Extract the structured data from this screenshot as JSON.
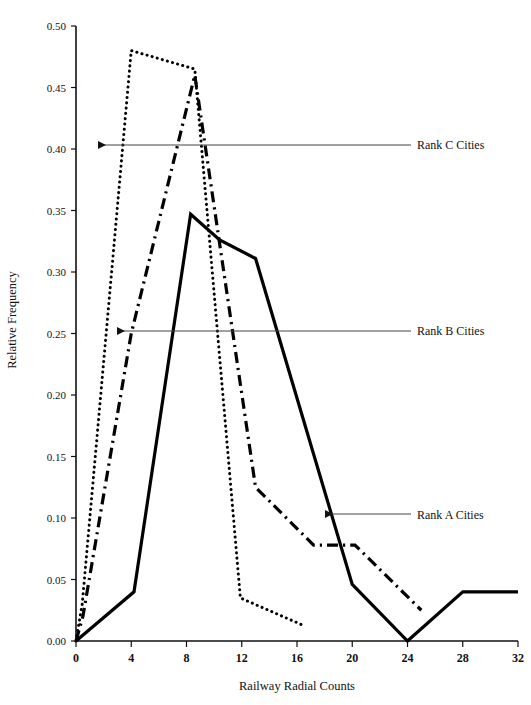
{
  "chart_data": {
    "type": "line",
    "title": "",
    "xlabel": "Railway Radial Counts",
    "ylabel": "Relative Frequency",
    "xlim": [
      0,
      32
    ],
    "ylim": [
      0.0,
      0.5
    ],
    "xticks": [
      0,
      4,
      8,
      12,
      16,
      20,
      24,
      28,
      32
    ],
    "xtick_labels": [
      "0",
      "4",
      "8",
      "12",
      "16",
      "20",
      "24",
      "28",
      "32"
    ],
    "yticks": [
      0.0,
      0.05,
      0.1,
      0.15,
      0.2,
      0.25,
      0.3,
      0.35,
      0.4,
      0.45,
      0.5
    ],
    "ytick_labels": [
      "0.00",
      "0.05",
      "0.10",
      "0.15",
      "0.20",
      "0.25",
      "0.30",
      "0.35",
      "0.40",
      "0.45",
      "0.50"
    ],
    "grid": false,
    "legend": "annotations with leader lines and arrows pointing at each curve",
    "series": [
      {
        "name": "Rank A Cities",
        "style": "solid",
        "color": "#000000",
        "points": [
          [
            0.0,
            0.0
          ],
          [
            4.2,
            0.04
          ],
          [
            8.3,
            0.347
          ],
          [
            10.4,
            0.326
          ],
          [
            13.0,
            0.311
          ],
          [
            20.0,
            0.046
          ],
          [
            24.0,
            0.0
          ],
          [
            28.0,
            0.04
          ],
          [
            32.0,
            0.04
          ]
        ]
      },
      {
        "name": "Rank B Cities",
        "style": "dash-dot",
        "color": "#000000",
        "points": [
          [
            0.0,
            0.0
          ],
          [
            0.5,
            0.02
          ],
          [
            4.0,
            0.25
          ],
          [
            8.6,
            0.46
          ],
          [
            13.0,
            0.125
          ],
          [
            17.2,
            0.078
          ],
          [
            20.2,
            0.078
          ],
          [
            25.0,
            0.025
          ]
        ]
      },
      {
        "name": "Rank C Cities",
        "style": "dotted",
        "color": "#000000",
        "points": [
          [
            0.0,
            0.0
          ],
          [
            0.45,
            0.03
          ],
          [
            4.0,
            0.48
          ],
          [
            8.6,
            0.465
          ],
          [
            11.9,
            0.035
          ],
          [
            16.6,
            0.012
          ]
        ]
      }
    ],
    "annotations": [
      {
        "id": "rank-c",
        "text": "Rank C Cities",
        "label_x": 417,
        "label_y": 149,
        "leader_from_x": 411,
        "leader_from_y": 145,
        "arrow_to_x": 98,
        "arrow_to_y": 145
      },
      {
        "id": "rank-b",
        "text": "Rank B Cities",
        "label_x": 417,
        "label_y": 335,
        "leader_from_x": 411,
        "leader_from_y": 331,
        "arrow_to_x": 117,
        "arrow_to_y": 331
      },
      {
        "id": "rank-a",
        "text": "Rank A Cities",
        "label_x": 417,
        "label_y": 519,
        "leader_from_x": 411,
        "leader_from_y": 514,
        "arrow_to_x": 325,
        "arrow_to_y": 514
      }
    ]
  },
  "axes": {
    "x_title": "Railway Radial Counts",
    "y_title": "Relative Frequency"
  }
}
